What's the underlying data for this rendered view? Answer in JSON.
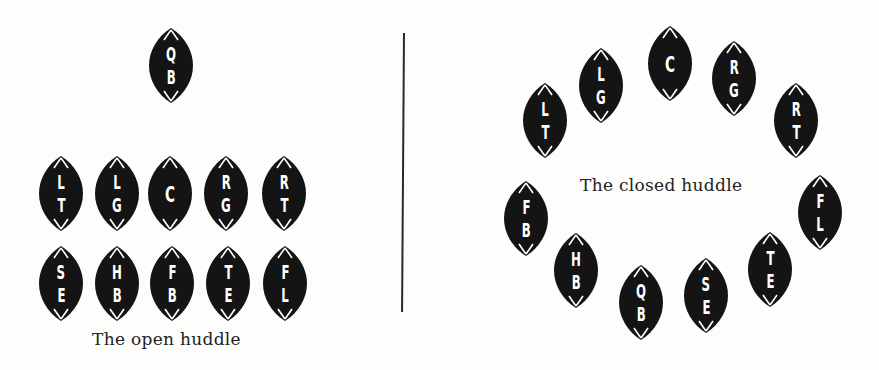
{
  "colors": {
    "ball": "#141414",
    "letters": "#ffffff",
    "caption": "#222222",
    "divider": "#2a2a2a"
  },
  "open_huddle": {
    "caption": "The open huddle",
    "players": [
      {
        "id": "QB",
        "top": "Q",
        "bottom": "B",
        "cx": 171,
        "cy": 65
      },
      {
        "id": "LT",
        "top": "L",
        "bottom": "T",
        "cx": 61,
        "cy": 193
      },
      {
        "id": "LG",
        "top": "L",
        "bottom": "G",
        "cx": 117,
        "cy": 193
      },
      {
        "id": "C",
        "top": "C",
        "bottom": "",
        "cx": 170,
        "cy": 193
      },
      {
        "id": "RG",
        "top": "R",
        "bottom": "G",
        "cx": 226,
        "cy": 193
      },
      {
        "id": "RT",
        "top": "R",
        "bottom": "T",
        "cx": 284,
        "cy": 193
      },
      {
        "id": "SE",
        "top": "S",
        "bottom": "E",
        "cx": 61,
        "cy": 283
      },
      {
        "id": "HB",
        "top": "H",
        "bottom": "B",
        "cx": 117,
        "cy": 283
      },
      {
        "id": "FB",
        "top": "F",
        "bottom": "B",
        "cx": 172,
        "cy": 283
      },
      {
        "id": "TE",
        "top": "T",
        "bottom": "E",
        "cx": 228,
        "cy": 283
      },
      {
        "id": "FL",
        "top": "F",
        "bottom": "L",
        "cx": 285,
        "cy": 283
      }
    ]
  },
  "closed_huddle": {
    "caption": "The closed huddle",
    "players": [
      {
        "id": "LT",
        "top": "L",
        "bottom": "T",
        "cx": 545,
        "cy": 120
      },
      {
        "id": "LG",
        "top": "L",
        "bottom": "G",
        "cx": 601,
        "cy": 85
      },
      {
        "id": "C",
        "top": "C",
        "bottom": "",
        "cx": 670,
        "cy": 63
      },
      {
        "id": "RG",
        "top": "R",
        "bottom": "G",
        "cx": 734,
        "cy": 78
      },
      {
        "id": "RT",
        "top": "R",
        "bottom": "T",
        "cx": 796,
        "cy": 120
      },
      {
        "id": "FL",
        "top": "F",
        "bottom": "L",
        "cx": 820,
        "cy": 212
      },
      {
        "id": "TE",
        "top": "T",
        "bottom": "E",
        "cx": 770,
        "cy": 269
      },
      {
        "id": "SE",
        "top": "S",
        "bottom": "E",
        "cx": 706,
        "cy": 295
      },
      {
        "id": "QB",
        "top": "Q",
        "bottom": "B",
        "cx": 641,
        "cy": 302
      },
      {
        "id": "HB",
        "top": "H",
        "bottom": "B",
        "cx": 576,
        "cy": 270
      },
      {
        "id": "FB",
        "top": "F",
        "bottom": "B",
        "cx": 526,
        "cy": 218
      }
    ]
  }
}
